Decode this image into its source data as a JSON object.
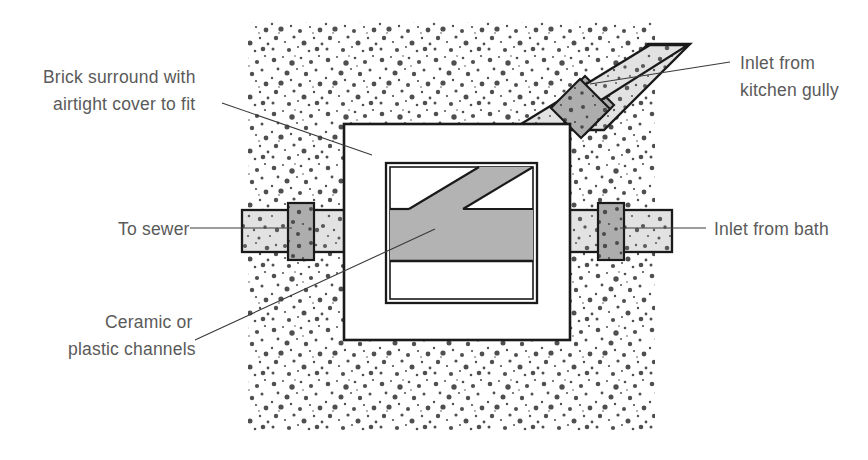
{
  "diagram": {
    "type": "technical-cross-section-plan",
    "background_color": "#ffffff",
    "labels": {
      "brick_surround_line1": "Brick surround with",
      "brick_surround_line2": "airtight cover to fit",
      "to_sewer": "To sewer",
      "ceramic_line1": "Ceramic or",
      "ceramic_line2": "plastic channels",
      "inlet_kitchen_line1": "Inlet from",
      "inlet_kitchen_line2": "kitchen gully",
      "inlet_bath": "Inlet from bath"
    },
    "colors": {
      "text": "#5a5a5a",
      "outline": "#1a1a1a",
      "leader": "#3a3a3a",
      "channel_fill": "#b3b3b3",
      "pipe_fill": "#d9d9d9",
      "collar_fill": "#a9a9a9",
      "concrete_fill": "#ffffff",
      "stipple_dot": "#555555"
    },
    "parts": {
      "concrete_surround": "stippled concrete bed",
      "chamber_wall": "brick surround with airtight cover",
      "inner_chamber": "ceramic or plastic channel box",
      "main_channel": "horizontal ceramic channel",
      "branch_channel": "diagonal branch channel",
      "pipe_left": "outlet pipe to sewer",
      "pipe_right": "inlet pipe from bath",
      "pipe_diagonal": "inlet pipe from kitchen gully"
    }
  }
}
